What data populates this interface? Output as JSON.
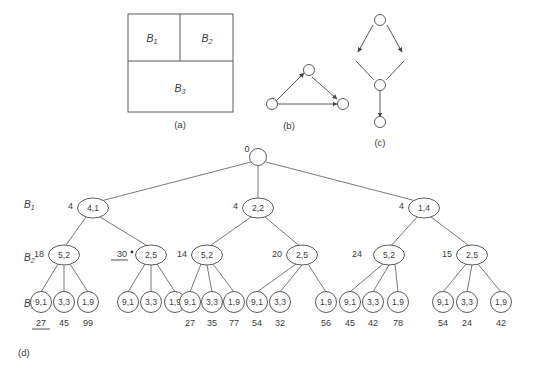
{
  "figure": {
    "panels": [
      {
        "id": "a",
        "caption": "(a)",
        "type": "block-partition",
        "blocks": [
          {
            "label": "B",
            "sub": "1"
          },
          {
            "label": "B",
            "sub": "2"
          },
          {
            "label": "B",
            "sub": "3"
          }
        ]
      },
      {
        "id": "b",
        "caption": "(b)",
        "type": "directed-graph",
        "nodes": 3,
        "edges": 3
      },
      {
        "id": "c",
        "caption": "(c)",
        "type": "directed-graph",
        "nodes": 4,
        "edges": 4
      },
      {
        "id": "d",
        "caption": "(d)",
        "type": "search-tree"
      }
    ],
    "row_labels": [
      {
        "label": "B",
        "sub": "1"
      },
      {
        "label": "B",
        "sub": "2"
      },
      {
        "label": "B",
        "sub": "3"
      }
    ],
    "root": {
      "cost": "0",
      "value": ""
    },
    "level1": [
      {
        "cost": "4",
        "value": "4,1"
      },
      {
        "cost": "4",
        "value": "2,2"
      },
      {
        "cost": "4",
        "value": "1,4"
      }
    ],
    "level2": [
      {
        "cost": "18",
        "value": "5,2",
        "underlined": false,
        "starred": false
      },
      {
        "cost": "30",
        "value": "2,5",
        "underlined": true,
        "starred": true
      },
      {
        "cost": "14",
        "value": "5,2",
        "underlined": false,
        "starred": false
      },
      {
        "cost": "20",
        "value": "2,5",
        "underlined": false,
        "starred": false
      },
      {
        "cost": "24",
        "value": "5,2",
        "underlined": false,
        "starred": false
      },
      {
        "cost": "15",
        "value": "2,5",
        "underlined": false,
        "starred": false
      }
    ],
    "leaf_groups": [
      {
        "values": [
          "9,1",
          "3,3",
          "1,9"
        ],
        "costs": [
          "27",
          "45",
          "99"
        ],
        "underlined": [
          true,
          false,
          false
        ]
      },
      {
        "values": [
          "9,1",
          "3,3",
          "1,9"
        ],
        "costs": [
          "",
          "",
          ""
        ],
        "underlined": [
          false,
          false,
          false
        ]
      },
      {
        "values": [
          "9,1",
          "3,3",
          "1,9"
        ],
        "costs": [
          "27",
          "35",
          "77"
        ],
        "underlined": [
          false,
          false,
          false
        ]
      },
      {
        "values": [
          "9,1",
          "3,3",
          "1,9"
        ],
        "costs": [
          "54",
          "32",
          "56"
        ],
        "underlined": [
          false,
          false,
          false
        ]
      },
      {
        "values": [
          "9,1",
          "3,3",
          "1,9"
        ],
        "costs": [
          "45",
          "42",
          "78"
        ],
        "underlined": [
          false,
          false,
          false
        ]
      },
      {
        "values": [
          "9,1",
          "3,3",
          "1,9"
        ],
        "costs": [
          "54",
          "24",
          "42"
        ],
        "underlined": [
          false,
          false,
          false
        ]
      }
    ]
  },
  "colors": {
    "ink": "#3a3a3a",
    "line": "#5b5b5b",
    "background": "#ffffff"
  }
}
